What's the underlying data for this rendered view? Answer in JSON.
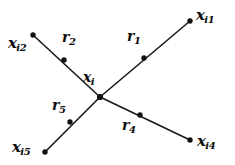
{
  "figure": {
    "kind": "vector-star-diagram",
    "background_color": "#ffffff",
    "stroke_color": "#1a1a1a",
    "node_color": "#111111"
  },
  "center_node": {
    "label_base": "x",
    "label_sub": "i",
    "x": 100,
    "y": 97,
    "label_x": 83,
    "label_y": 70
  },
  "endpoints": [
    {
      "id": "xi1",
      "label_base": "x",
      "label_sub": "i1",
      "x": 190,
      "y": 21,
      "label_x": 196,
      "label_y": 8
    },
    {
      "id": "xi2",
      "label_base": "x",
      "label_sub": "i2",
      "x": 33,
      "y": 35,
      "label_x": 8,
      "label_y": 36
    },
    {
      "id": "xi4",
      "label_base": "x",
      "label_sub": "i4",
      "x": 190,
      "y": 140,
      "label_x": 197,
      "label_y": 134
    },
    {
      "id": "xi5",
      "label_base": "x",
      "label_sub": "i5",
      "x": 45,
      "y": 152,
      "label_x": 12,
      "label_y": 140
    }
  ],
  "vectors": [
    {
      "id": "r1",
      "label_base": "r",
      "label_sub": "1",
      "dot_x": 144,
      "dot_y": 58,
      "label_x": 127,
      "label_y": 29,
      "to": "xi1"
    },
    {
      "id": "r2",
      "label_base": "r",
      "label_sub": "2",
      "dot_x": 64,
      "dot_y": 60,
      "label_x": 62,
      "label_y": 30,
      "to": "xi2"
    },
    {
      "id": "r4",
      "label_base": "r",
      "label_sub": "4",
      "dot_x": 140,
      "dot_y": 115,
      "label_x": 122,
      "label_y": 118,
      "to": "xi4"
    },
    {
      "id": "r5",
      "label_base": "r",
      "label_sub": "5",
      "dot_x": 70,
      "dot_y": 122,
      "label_x": 52,
      "label_y": 98,
      "to": "xi5"
    }
  ]
}
